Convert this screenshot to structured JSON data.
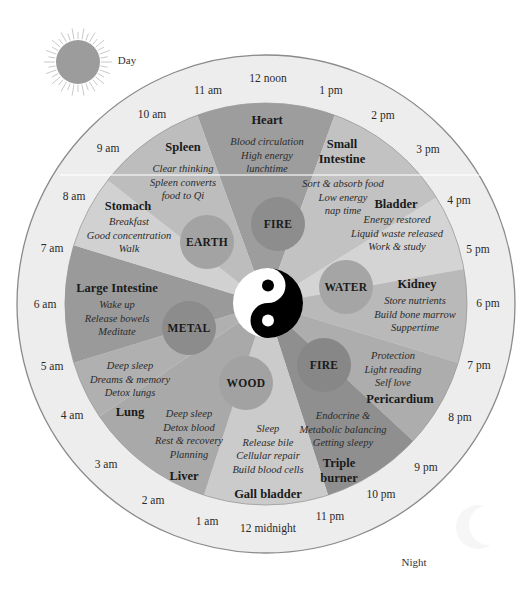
{
  "legend": {
    "day_label": "Day",
    "night_label": "Night",
    "sun_icon": "sun-icon",
    "moon_icon": "crescent-moon-icon"
  },
  "colors": {
    "outer_ring": "#ededed",
    "outer_ring_stroke": "#8a8a8a",
    "sun": "#9c9c9c",
    "yin": "#000000",
    "yang": "#ffffff"
  },
  "hours": [
    {
      "label": "12 noon",
      "x": 268,
      "y": 78
    },
    {
      "label": "1 pm",
      "x": 331,
      "y": 90
    },
    {
      "label": "2 pm",
      "x": 383,
      "y": 115
    },
    {
      "label": "3 pm",
      "x": 428,
      "y": 149
    },
    {
      "label": "4 pm",
      "x": 459,
      "y": 200
    },
    {
      "label": "5 pm",
      "x": 478,
      "y": 249
    },
    {
      "label": "6 pm",
      "x": 488,
      "y": 303
    },
    {
      "label": "7 pm",
      "x": 479,
      "y": 365
    },
    {
      "label": "8 pm",
      "x": 460,
      "y": 417
    },
    {
      "label": "9 pm",
      "x": 426,
      "y": 467
    },
    {
      "label": "10 pm",
      "x": 381,
      "y": 494
    },
    {
      "label": "11 pm",
      "x": 330,
      "y": 516
    },
    {
      "label": "12 midnight",
      "x": 268,
      "y": 528
    },
    {
      "label": "1 am",
      "x": 207,
      "y": 521
    },
    {
      "label": "2 am",
      "x": 153,
      "y": 500
    },
    {
      "label": "3 am",
      "x": 106,
      "y": 464
    },
    {
      "label": "4 am",
      "x": 72,
      "y": 415
    },
    {
      "label": "5 am",
      "x": 52,
      "y": 366
    },
    {
      "label": "6 am",
      "x": 45,
      "y": 304
    },
    {
      "label": "7 am",
      "x": 52,
      "y": 248
    },
    {
      "label": "8 am",
      "x": 74,
      "y": 196
    },
    {
      "label": "9 am",
      "x": 108,
      "y": 148
    },
    {
      "label": "10 am",
      "x": 152,
      "y": 114
    },
    {
      "label": "11 am",
      "x": 208,
      "y": 90
    }
  ],
  "organs": [
    {
      "name": "Heart",
      "element": "FIRE",
      "desc": [
        "Blood circulation",
        "High energy",
        "lunchtime"
      ],
      "color": "#9d9d9d",
      "a0": -20,
      "a1": 20,
      "nx": 267,
      "ny": 120,
      "dx": 267,
      "dy": 155,
      "order": "name-first"
    },
    {
      "name": "Small Intestine",
      "name_lines": [
        "Small",
        "Intestine"
      ],
      "element": "FIRE",
      "desc": [
        "Sort & absorb food",
        "Low energy",
        "nap time"
      ],
      "color": "#c2c2c2",
      "a0": 20,
      "a1": 58,
      "nx": 342,
      "ny": 152,
      "dx": 343,
      "dy": 197,
      "order": "name-first"
    },
    {
      "name": "Bladder",
      "element": "WATER",
      "desc": [
        "Energy restored",
        "Liquid waste released",
        "Work & study"
      ],
      "color": "#d4d4d4",
      "a0": 58,
      "a1": 80,
      "nx": 396,
      "ny": 204,
      "dx": 397,
      "dy": 233,
      "order": "name-first"
    },
    {
      "name": "Kidney",
      "element": "WATER",
      "desc": [
        "Store nutrients",
        "Build bone marrow",
        "Suppertime"
      ],
      "color": "#b9b9b9",
      "a0": 80,
      "a1": 107,
      "nx": 417,
      "ny": 284,
      "dx": 415,
      "dy": 314,
      "order": "name-first"
    },
    {
      "name": "Pericardium",
      "element": "FIRE",
      "desc": [
        "Protection",
        "Light reading",
        "Self love"
      ],
      "color": "#adadad",
      "a0": 107,
      "a1": 133,
      "nx": 400,
      "ny": 399,
      "dx": 393,
      "dy": 369,
      "order": "desc-first"
    },
    {
      "name": "Triple burner",
      "name_lines": [
        "Triple",
        "burner"
      ],
      "element": "FIRE",
      "desc": [
        "Endocrine &",
        "Metabolic balancing",
        "Getting sleepy"
      ],
      "color": "#8f8f8f",
      "a0": 133,
      "a1": 162,
      "nx": 339,
      "ny": 471,
      "dx": 343,
      "dy": 429,
      "order": "desc-first"
    },
    {
      "name": "Gall bladder",
      "element": "WOOD",
      "desc": [
        "Sleep",
        "Release bile",
        "Cellular repair",
        "Build blood cells"
      ],
      "color": "#cbcbcb",
      "a0": 162,
      "a1": 198,
      "nx": 268,
      "ny": 494,
      "dx": 268,
      "dy": 449,
      "order": "desc-first"
    },
    {
      "name": "Liver",
      "element": "WOOD",
      "desc": [
        "Deep sleep",
        "Detox blood",
        "Rest & recovery",
        "Planning"
      ],
      "color": "#a9a9a9",
      "a0": 198,
      "a1": 236,
      "nx": 184,
      "ny": 476,
      "dx": 189,
      "dy": 434,
      "order": "desc-first"
    },
    {
      "name": "Lung",
      "element": "METAL",
      "desc": [
        "Deep sleep",
        "Dreams & memory",
        "Detox lungs"
      ],
      "color": "#b0b0b0",
      "a0": 236,
      "a1": 253,
      "nx": 130,
      "ny": 412,
      "dx": 130,
      "dy": 379,
      "order": "desc-first"
    },
    {
      "name": "Large Intestine",
      "element": "METAL",
      "desc": [
        "Wake up",
        "Release bowels",
        "Meditate"
      ],
      "color": "#9a9a9a",
      "a0": 253,
      "a1": 287,
      "nx": 117,
      "ny": 288,
      "dx": 117,
      "dy": 318,
      "order": "name-first"
    },
    {
      "name": "Stomach",
      "element": "EARTH",
      "desc": [
        "Breakfast",
        "Good concentration",
        "Walk"
      ],
      "color": "#d1d1d1",
      "a0": 287,
      "a1": 308,
      "nx": 128,
      "ny": 206,
      "dx": 129,
      "dy": 235,
      "order": "name-first"
    },
    {
      "name": "Spleen",
      "element": "EARTH",
      "desc": [
        "Clear thinking",
        "Spleen converts",
        "food to Qi"
      ],
      "color": "#bdbdbd",
      "a0": 308,
      "a1": 340,
      "nx": 183,
      "ny": 147,
      "dx": 183,
      "dy": 182,
      "order": "name-first"
    }
  ],
  "elements": [
    {
      "label": "EARTH",
      "x": 207,
      "y": 242,
      "r": 27,
      "color": "#a3a3a3"
    },
    {
      "label": "FIRE",
      "x": 278,
      "y": 224,
      "r": 27,
      "color": "#8d8d8d"
    },
    {
      "label": "WATER",
      "x": 346,
      "y": 287,
      "r": 27,
      "color": "#a5a5a5"
    },
    {
      "label": "FIRE",
      "x": 324,
      "y": 365,
      "r": 27,
      "color": "#878787"
    },
    {
      "label": "WOOD",
      "x": 246,
      "y": 383,
      "r": 27,
      "color": "#a2a2a2"
    },
    {
      "label": "METAL",
      "x": 189,
      "y": 328,
      "r": 27,
      "color": "#8c8c8c"
    }
  ]
}
